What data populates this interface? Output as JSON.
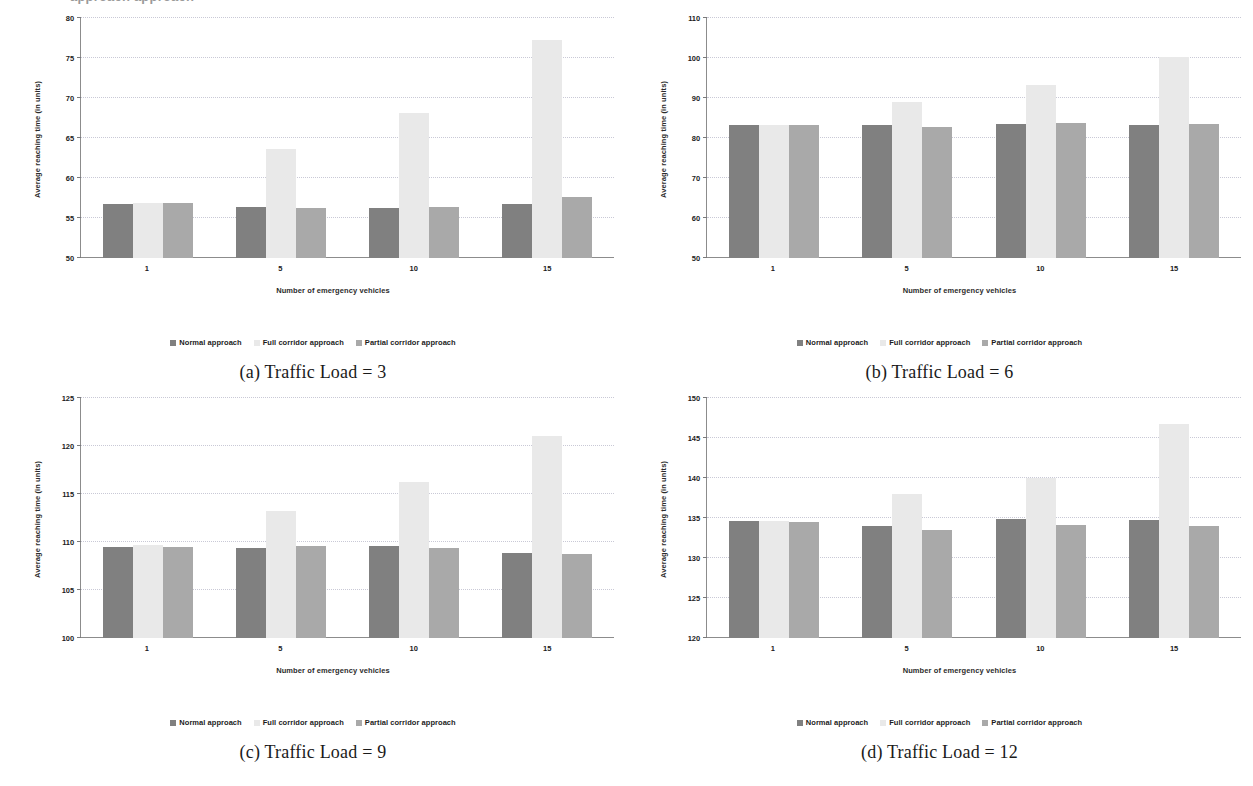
{
  "page": {
    "top_cut_text": "approach             approach",
    "bottom_cut_text": " "
  },
  "legend": {
    "items": [
      {
        "label": "Normal approach",
        "color": "#808080"
      },
      {
        "label": "Full corridor approach",
        "color": "#e9e9e9"
      },
      {
        "label": "Partial corridor approach",
        "color": "#a9a9a9"
      }
    ]
  },
  "axes": {
    "xlabel": "Number of emergency vehicles",
    "ylabel": "Average reaching time (in units)"
  },
  "chart_data": [
    {
      "id": "a",
      "type": "bar",
      "caption": "(a) Traffic Load = 3",
      "title": "",
      "xlabel": "Number of emergency vehicles",
      "ylabel": "Average reaching time (in units)",
      "categories": [
        "1",
        "5",
        "10",
        "15"
      ],
      "ylim": [
        50,
        80
      ],
      "yticks": [
        50,
        55,
        60,
        65,
        70,
        75,
        80
      ],
      "grid": true,
      "legend_position": "bottom",
      "series": [
        {
          "name": "Normal approach",
          "color": "#808080",
          "values": [
            56.7,
            56.4,
            56.3,
            56.8
          ]
        },
        {
          "name": "Full corridor approach",
          "color": "#e9e9e9",
          "values": [
            56.9,
            63.6,
            68.1,
            77.2
          ]
        },
        {
          "name": "Partial corridor approach",
          "color": "#a9a9a9",
          "values": [
            56.9,
            56.2,
            56.4,
            57.6
          ]
        }
      ]
    },
    {
      "id": "b",
      "type": "bar",
      "caption": "(b) Traffic Load = 6",
      "title": "",
      "xlabel": "Number of emergency vehicles",
      "ylabel": "Average reaching time (in units)",
      "categories": [
        "1",
        "5",
        "10",
        "15"
      ],
      "ylim": [
        50,
        110
      ],
      "yticks": [
        50,
        60,
        70,
        80,
        90,
        100,
        110
      ],
      "grid": true,
      "legend_position": "bottom",
      "series": [
        {
          "name": "Normal approach",
          "color": "#808080",
          "values": [
            83.3,
            83.3,
            83.4,
            83.3
          ]
        },
        {
          "name": "Full corridor approach",
          "color": "#e9e9e9",
          "values": [
            83.3,
            88.9,
            93.2,
            100.2
          ]
        },
        {
          "name": "Partial corridor approach",
          "color": "#a9a9a9",
          "values": [
            83.3,
            82.8,
            83.7,
            83.6
          ]
        }
      ]
    },
    {
      "id": "c",
      "type": "bar",
      "caption": "(c) Traffic Load = 9",
      "title": "",
      "xlabel": "Number of emergency vehicles",
      "ylabel": "Average reaching time (in units)",
      "categories": [
        "1",
        "5",
        "10",
        "15"
      ],
      "ylim": [
        100,
        125
      ],
      "yticks": [
        100,
        105,
        110,
        115,
        120,
        125
      ],
      "grid": true,
      "legend_position": "bottom",
      "series": [
        {
          "name": "Normal approach",
          "color": "#808080",
          "values": [
            109.5,
            109.4,
            109.6,
            108.9
          ]
        },
        {
          "name": "Full corridor approach",
          "color": "#e9e9e9",
          "values": [
            109.7,
            113.2,
            116.2,
            121.0
          ]
        },
        {
          "name": "Partial corridor approach",
          "color": "#a9a9a9",
          "values": [
            109.5,
            109.6,
            109.4,
            108.8
          ]
        }
      ]
    },
    {
      "id": "d",
      "type": "bar",
      "caption": "(d) Traffic Load = 12",
      "title": "",
      "xlabel": "Number of emergency vehicles",
      "ylabel": "Average reaching time (in units)",
      "categories": [
        "1",
        "5",
        "10",
        "15"
      ],
      "ylim": [
        120,
        150
      ],
      "yticks": [
        120,
        125,
        130,
        135,
        140,
        145,
        150
      ],
      "grid": true,
      "legend_position": "bottom",
      "series": [
        {
          "name": "Normal approach",
          "color": "#808080",
          "values": [
            134.6,
            134.0,
            134.9,
            134.7
          ]
        },
        {
          "name": "Full corridor approach",
          "color": "#e9e9e9",
          "values": [
            134.6,
            138.0,
            140.0,
            146.7
          ]
        },
        {
          "name": "Partial corridor approach",
          "color": "#a9a9a9",
          "values": [
            134.5,
            133.5,
            134.1,
            134.0
          ]
        }
      ]
    }
  ]
}
